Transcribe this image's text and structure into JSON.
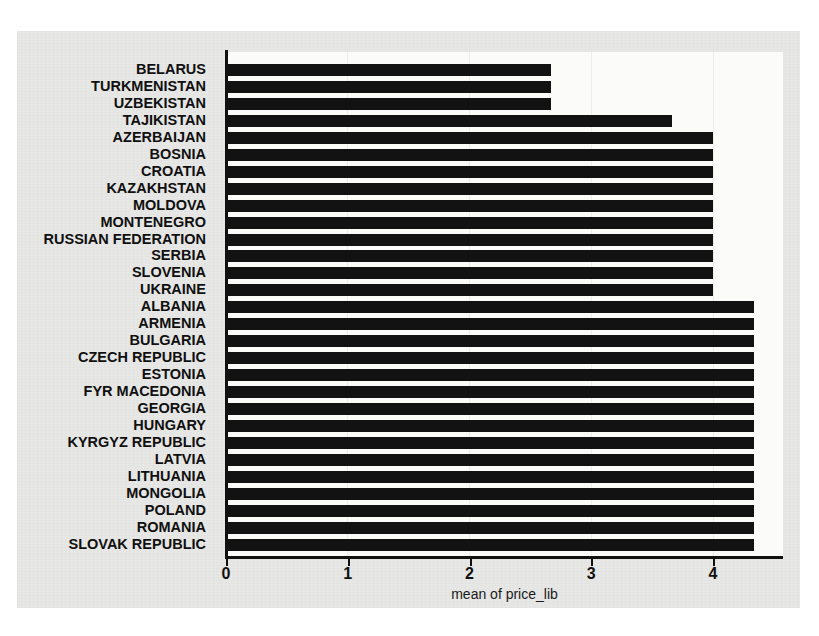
{
  "chart_data": {
    "type": "bar",
    "orientation": "horizontal",
    "title": "",
    "xlabel": "mean of price_lib",
    "ylabel": "",
    "xlim": [
      0,
      4.58
    ],
    "xticks": [
      0,
      1,
      2,
      3,
      4
    ],
    "xtick_labels": [
      "0",
      "1",
      "2",
      "3",
      "4"
    ],
    "grid": true,
    "legend": null,
    "bar_color": "#121212",
    "background_color": "#e7e7e5",
    "plot_background_color": "#fbfbfa",
    "categories": [
      "BELARUS",
      "TURKMENISTAN",
      "UZBEKISTAN",
      "TAJIKISTAN",
      "AZERBAIJAN",
      "BOSNIA",
      "CROATIA",
      "KAZAKHSTAN",
      "MOLDOVA",
      "MONTENEGRO",
      "RUSSIAN FEDERATION",
      "SERBIA",
      "SLOVENIA",
      "UKRAINE",
      "ALBANIA",
      "ARMENIA",
      "BULGARIA",
      "CZECH REPUBLIC",
      "ESTONIA",
      "FYR MACEDONIA",
      "GEORGIA",
      "HUNGARY",
      "KYRGYZ REPUBLIC",
      "LATVIA",
      "LITHUANIA",
      "MONGOLIA",
      "POLAND",
      "ROMANIA",
      "SLOVAK REPUBLIC"
    ],
    "values": [
      2.67,
      2.67,
      2.67,
      3.66,
      4.0,
      4.0,
      4.0,
      4.0,
      4.0,
      4.0,
      4.0,
      4.0,
      4.0,
      4.0,
      4.34,
      4.34,
      4.34,
      4.34,
      4.34,
      4.34,
      4.34,
      4.34,
      4.34,
      4.34,
      4.34,
      4.34,
      4.34,
      4.34,
      4.34
    ]
  }
}
